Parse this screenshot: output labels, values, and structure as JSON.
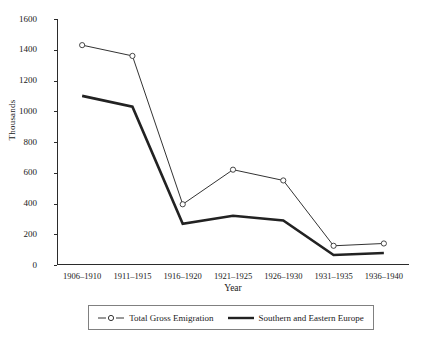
{
  "chart_data": {
    "type": "line",
    "title": "",
    "xlabel": "Year",
    "ylabel": "Thousands",
    "categories": [
      "1906–1910",
      "1911–1915",
      "1916–1920",
      "1921–1925",
      "1926–1930",
      "1931–1935",
      "1936–1940"
    ],
    "series": [
      {
        "name": "Total Gross Emigration",
        "values": [
          1430,
          1360,
          395,
          620,
          550,
          125,
          140
        ],
        "color": "#333333",
        "marker": "open-circle",
        "line_width": 1
      },
      {
        "name": "Southern and Eastern Europe",
        "values": [
          1100,
          1030,
          268,
          320,
          290,
          65,
          78
        ],
        "color": "#222222",
        "marker": "none",
        "line_width": 2.6
      }
    ],
    "ylim": [
      0,
      1600
    ],
    "yticks": [
      0,
      200,
      400,
      600,
      800,
      1000,
      1200,
      1400,
      1600
    ],
    "ytick_labels": [
      "0",
      "200",
      "400",
      "600",
      "800",
      "1000",
      "1200",
      "1400",
      "1600"
    ],
    "grid": false,
    "legend_position": "bottom"
  },
  "legend": {
    "entries": [
      {
        "label": "Total Gross Emigration"
      },
      {
        "label": "Southern and Eastern Europe"
      }
    ]
  }
}
